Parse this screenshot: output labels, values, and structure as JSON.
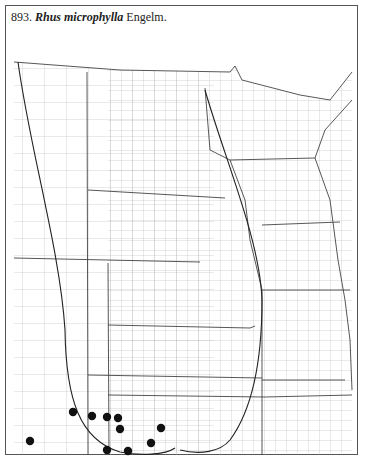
{
  "map": {
    "number": "893.",
    "genus_species": "Rhus microphylla",
    "authority": "Engelm.",
    "colors": {
      "ink": "#222222",
      "county_lines": "#9a9a9a",
      "state_lines": "#444444",
      "dots": "#111111"
    },
    "records": [
      {
        "x": 73,
        "y": 412
      },
      {
        "x": 92,
        "y": 416
      },
      {
        "x": 107,
        "y": 417
      },
      {
        "x": 118,
        "y": 418
      },
      {
        "x": 120,
        "y": 429
      },
      {
        "x": 161,
        "y": 428
      },
      {
        "x": 151,
        "y": 443
      },
      {
        "x": 30,
        "y": 441
      },
      {
        "x": 107,
        "y": 450
      },
      {
        "x": 128,
        "y": 451
      }
    ]
  }
}
